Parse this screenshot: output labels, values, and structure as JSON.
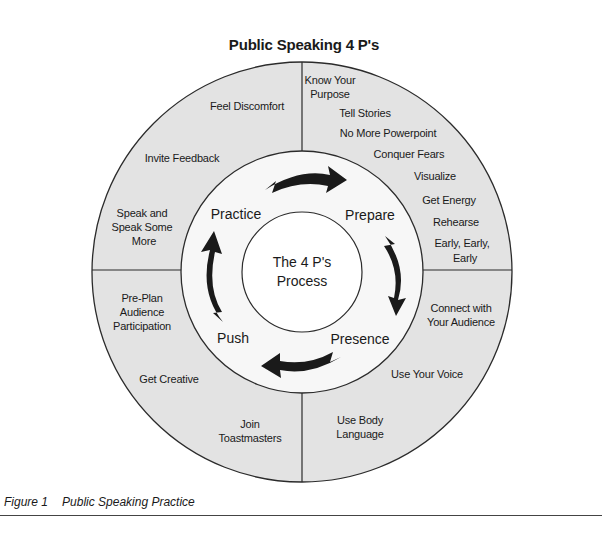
{
  "title": "Public Speaking 4 P's",
  "center": {
    "line1": "The 4 P's",
    "line2": "Process"
  },
  "stages": {
    "prepare": "Prepare",
    "presence": "Presence",
    "push": "Push",
    "practice": "Practice"
  },
  "quadrants": {
    "prepare": [
      "Know Your",
      "Purpose",
      "Tell Stories",
      "No More Powerpoint",
      "Conquer Fears",
      "Visualize",
      "Get Energy",
      "Rehearse",
      "Early, Early,",
      "Early"
    ],
    "presence": [
      "Connect with",
      "Your Audience",
      "Use Your Voice",
      "Use Body",
      "Language"
    ],
    "push": [
      "Pre-Plan",
      "Audience",
      "Participation",
      "Get Creative",
      "Join",
      "Toastmasters"
    ],
    "practice": [
      "Feel Discomfort",
      "Invite Feedback",
      "Speak and",
      "Speak Some",
      "More"
    ]
  },
  "caption": {
    "number": "Figure 1",
    "text": "Public Speaking Practice"
  },
  "colors": {
    "ring_fill": "#e3e3e3",
    "inner_fill": "#ffffff",
    "stroke": "#2b2b2b",
    "arrow": "#1a1a1a"
  }
}
